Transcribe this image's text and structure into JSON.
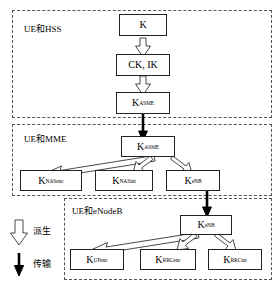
{
  "diagram": {
    "panels": [
      {
        "id": "hss",
        "label": "UE和HSS"
      },
      {
        "id": "mme",
        "label": "UE和MME"
      },
      {
        "id": "enodeb",
        "label": "UE和eNodeB"
      }
    ],
    "nodes": [
      {
        "id": "k",
        "base": "K",
        "sub": ""
      },
      {
        "id": "ckik",
        "base": "CK, IK",
        "sub": ""
      },
      {
        "id": "kasme1",
        "base": "K",
        "sub": "ASME"
      },
      {
        "id": "kasme2",
        "base": "K",
        "sub": "ASME"
      },
      {
        "id": "knasenc",
        "base": "K",
        "sub": "NASenc"
      },
      {
        "id": "knasint",
        "base": "K",
        "sub": "NASint"
      },
      {
        "id": "kenb1",
        "base": "K",
        "sub": "eNB"
      },
      {
        "id": "kenb2",
        "base": "K",
        "sub": "eNB"
      },
      {
        "id": "kupenc",
        "base": "K",
        "sub": "UPenc"
      },
      {
        "id": "krrcenc",
        "base": "K",
        "sub": "RRCenc"
      },
      {
        "id": "krrcint",
        "base": "K",
        "sub": "RRCint"
      }
    ],
    "edges": [
      {
        "from": "k",
        "to": "ckik",
        "kind": "derive"
      },
      {
        "from": "ckik",
        "to": "kasme1",
        "kind": "derive"
      },
      {
        "from": "kasme1",
        "to": "kasme2",
        "kind": "transmit"
      },
      {
        "from": "kasme2",
        "to": "knasenc",
        "kind": "derive"
      },
      {
        "from": "kasme2",
        "to": "knasint",
        "kind": "derive"
      },
      {
        "from": "kasme2",
        "to": "kenb1",
        "kind": "derive"
      },
      {
        "from": "kenb1",
        "to": "kenb2",
        "kind": "transmit"
      },
      {
        "from": "kenb2",
        "to": "kupenc",
        "kind": "derive"
      },
      {
        "from": "kenb2",
        "to": "krrcenc",
        "kind": "derive"
      },
      {
        "from": "kenb2",
        "to": "krrcint",
        "kind": "derive"
      }
    ],
    "legend": [
      {
        "id": "derive",
        "label": "派生",
        "arrow": "hollow-arrow-icon"
      },
      {
        "id": "transmit",
        "label": "传输",
        "arrow": "solid-arrow-icon"
      }
    ],
    "colors": {
      "panel_border": "#555555",
      "box_border": "#222222",
      "arrow_outline": "#333333",
      "arrow_fill": "#ffffff",
      "solid_arrow": "#000000",
      "background": "#ffffff"
    }
  }
}
